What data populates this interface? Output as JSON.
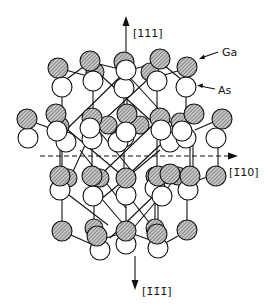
{
  "figure": {
    "type": "crystal-structure",
    "title": "",
    "labels": {
      "axis_up": "[111]",
      "axis_down": "[1̄1̄1̄]",
      "axis_right": "[1̄10]",
      "species_ga": "Ga",
      "species_as": "As"
    },
    "legend": [
      {
        "species": "Ga",
        "style": "hatched-circle",
        "color": "#888888"
      },
      {
        "species": "As",
        "style": "open-circle",
        "color": "#ffffff"
      }
    ],
    "atom_radius": 10,
    "colors": {
      "ink": "#111111",
      "ga_fill": "#9a9a9a",
      "as_fill": "#ffffff",
      "background": "#ffffff"
    }
  }
}
